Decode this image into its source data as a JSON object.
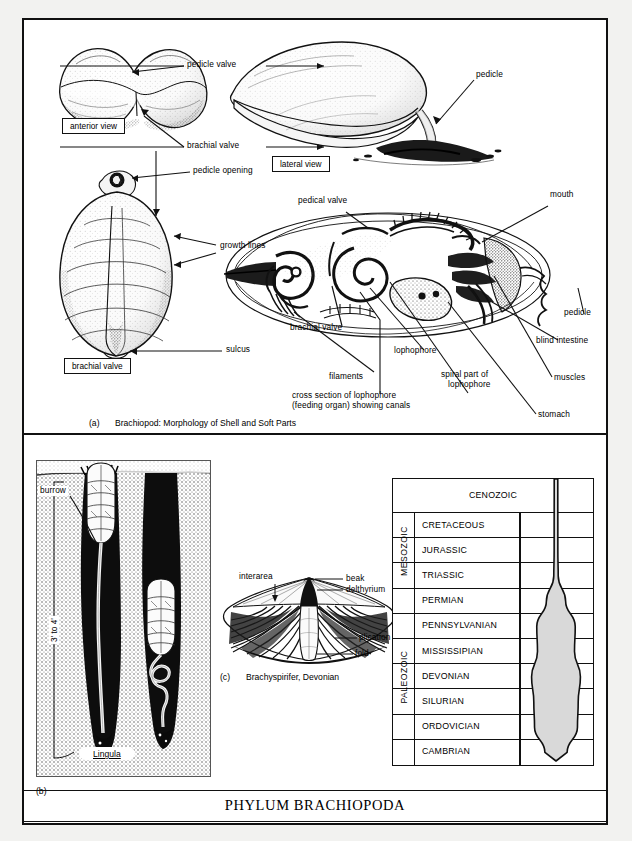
{
  "plate": {
    "title": "PHYLUM BRACHIOPODA"
  },
  "panel_a": {
    "caption_id": "(a)",
    "caption_text": "Brachiopod: Morphology of Shell and Soft Parts",
    "boxed_labels": {
      "anterior_view": "anterior view",
      "lateral_view": "lateral view",
      "brachial_valve": "brachial valve"
    },
    "labels": {
      "pedicle_valve": "pedicle valve",
      "brachial_valve": "brachial valve",
      "pedicle_opening": "pedicle opening",
      "growth_lines": "growth lines",
      "sulcus": "sulcus",
      "pedicle": "pedicle",
      "pedical_valve": "pedical valve",
      "mouth": "mouth",
      "brachial_valve_2": "brachial valve",
      "filaments": "filaments",
      "lophophore": "lophophore",
      "cross_section_line1": "cross section of lophophore",
      "cross_section_line2": "(feeding organ) showing canals",
      "spiral_part_line1": "spiral part of",
      "spiral_part_line2": "lophophore",
      "stomach": "stomach",
      "muscles": "muscles",
      "blind_intestine": "blind intestine",
      "pedicle_2": "pedicle"
    }
  },
  "panel_b": {
    "panel_id": "(b)",
    "labels": {
      "burrow": "burrow",
      "depth": "3' to 4'",
      "genus": "Lingula"
    }
  },
  "panel_c": {
    "caption_id": "(c)",
    "caption_text": "Brachyspirifer, Devonian",
    "labels": {
      "interarea": "interarea",
      "beak": "beak",
      "delthyrium": "delthyrium",
      "plication": "plication",
      "fold": "fold"
    }
  },
  "chart_data": {
    "type": "area",
    "orientation": "vertical",
    "xlabel": "relative abundance / diversity",
    "ylabel": "geologic time",
    "grid": true,
    "legend": "none",
    "eras": [
      {
        "name": "CENOZOIC",
        "spans_full_width": true,
        "periods": [
          "CENOZOIC"
        ]
      },
      {
        "name": "MESOZOIC",
        "spans_full_width": false,
        "periods": [
          "CRETACEOUS",
          "JURASSIC",
          "TRIASSIC"
        ]
      },
      {
        "name": "PALEOZOIC",
        "spans_full_width": false,
        "periods": [
          "PERMIAN",
          "PENNSYLVANIAN",
          "MISSISSIPIAN",
          "DEVONIAN",
          "SILURIAN",
          "ORDOVICIAN",
          "CAMBRIAN"
        ]
      }
    ],
    "categories": [
      "CENOZOIC",
      "CRETACEOUS",
      "JURASSIC",
      "TRIASSIC",
      "PERMIAN",
      "PENNSYLVANIAN",
      "MISSISSIPIAN",
      "DEVONIAN",
      "SILURIAN",
      "ORDOVICIAN",
      "CAMBRIAN"
    ],
    "values": [
      4,
      5,
      5,
      6,
      26,
      52,
      50,
      66,
      60,
      58,
      30
    ],
    "ylim": [
      0,
      100
    ]
  }
}
